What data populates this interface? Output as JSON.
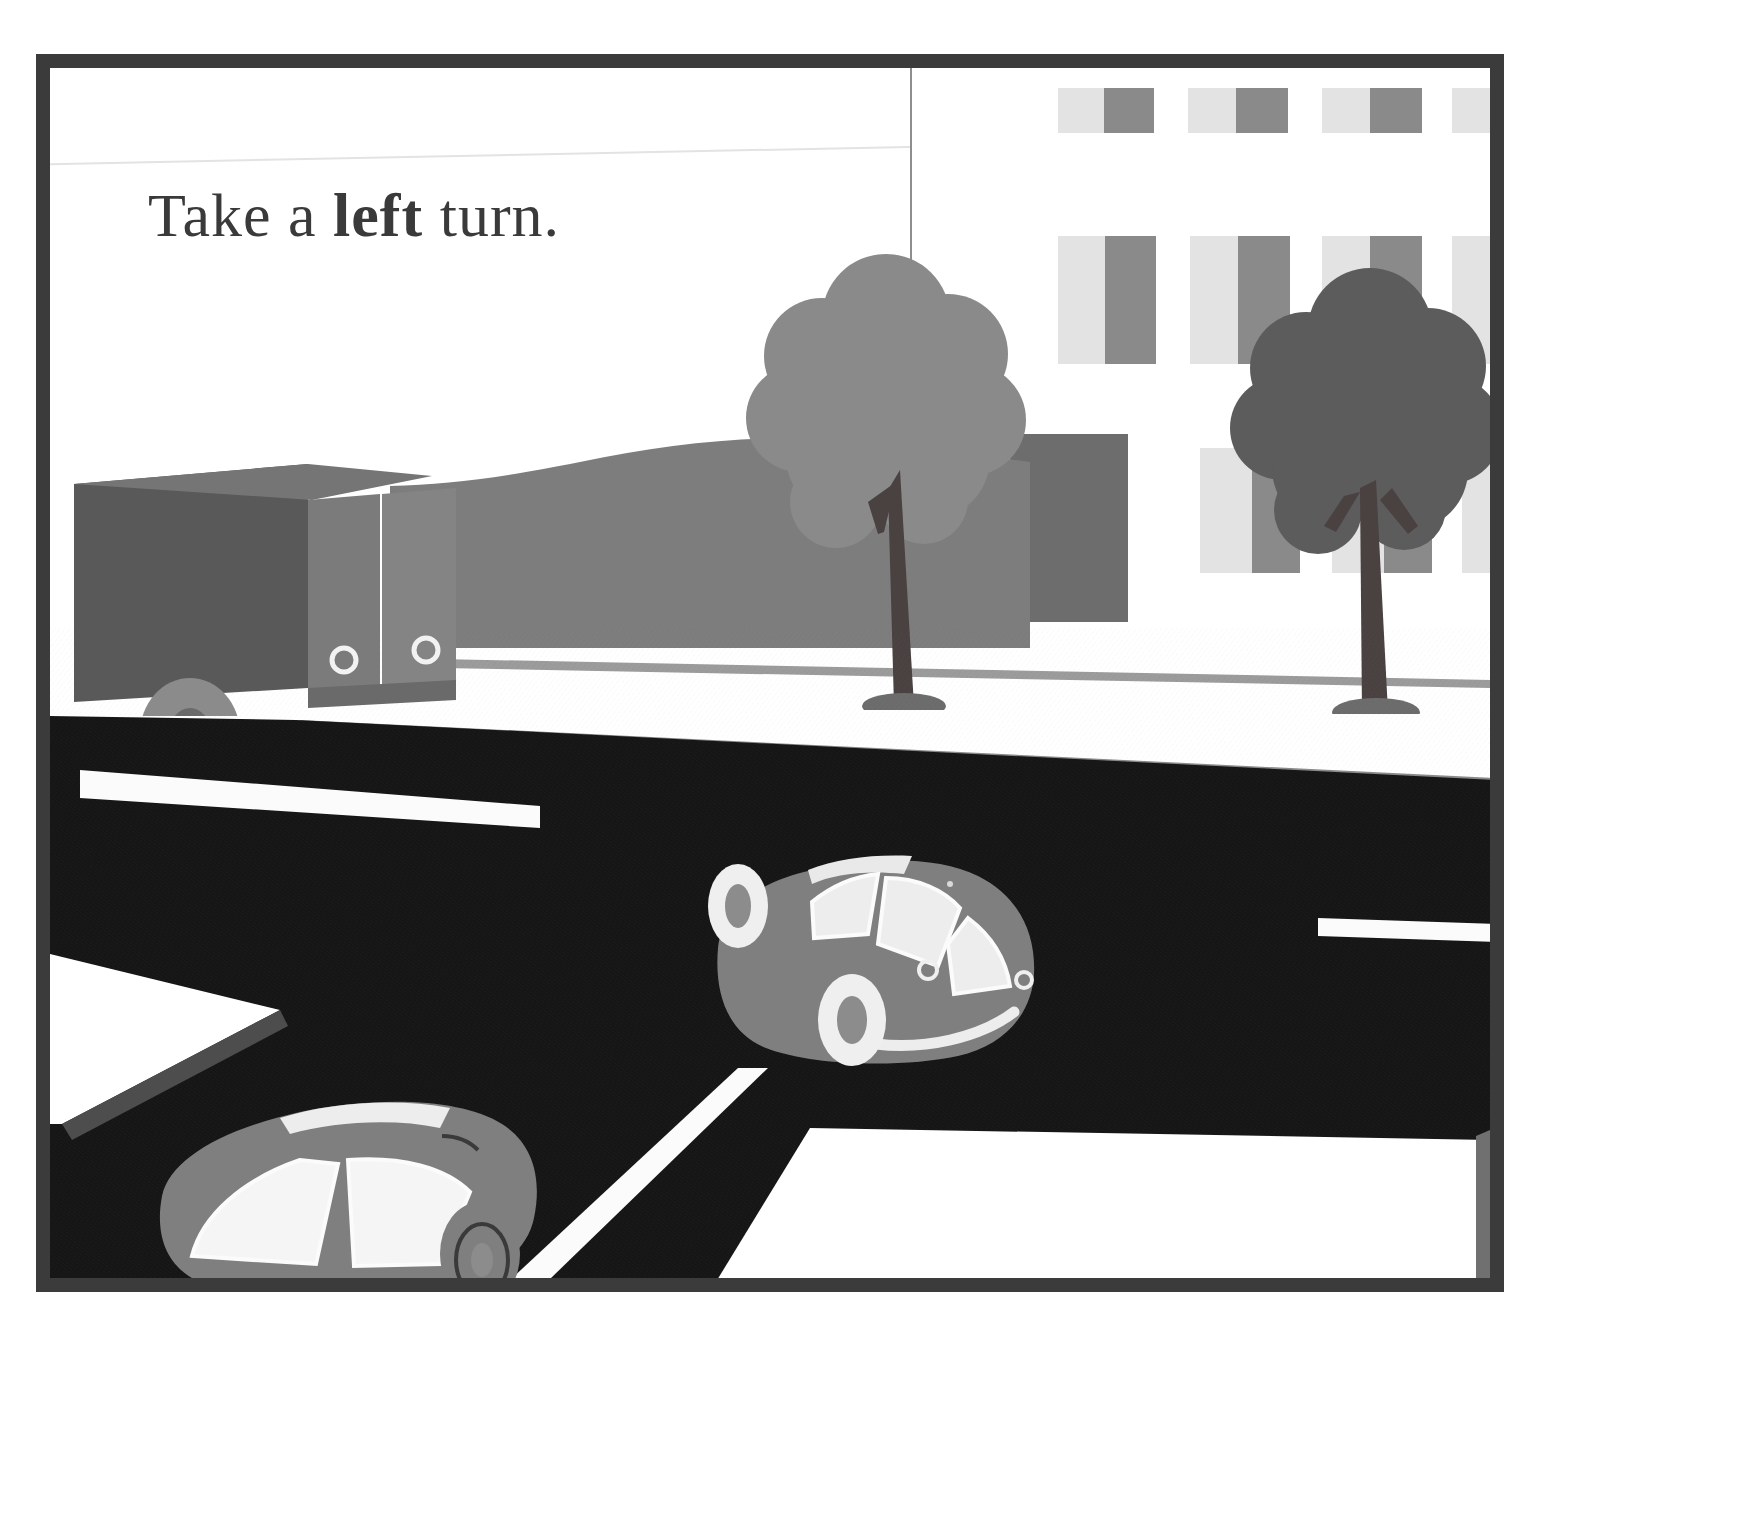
{
  "page": {
    "width": 1758,
    "height": 1521,
    "background": "#ffffff"
  },
  "illustration": {
    "title": "Take a left turn.",
    "style": "flat vector street scene illustration",
    "frame_color": "#3b3b3b"
  },
  "caption": {
    "text_before": "Take a ",
    "emphasis": "left",
    "text_after": " turn.",
    "full_text": "Take a left turn.",
    "color": "#3a3a3a"
  },
  "palette": {
    "sky": "#ffffff",
    "hill": "#7d7d7d",
    "road": "#161616",
    "road_marking": "#fbfbfb",
    "sidewalk": "#ffffff",
    "curb": "#8a8a8a",
    "car_body": "#7f7f7f",
    "car_glass": "#ededed",
    "truck_side": "#595959",
    "truck_front": "#7b7b7b",
    "tree_left_canopy": "#8a8a8a",
    "tree_right_canopy": "#5c5c5c",
    "tree_trunk": "#4a4141",
    "window_light": "#e3e3e3",
    "window_dark": "#8a8a8a",
    "door": "#6d6d6d",
    "frame": "#3b3b3b"
  },
  "scene_objects": {
    "sky": {
      "label": "sky backdrop"
    },
    "hill": {
      "label": "background hill"
    },
    "building": {
      "label": "city building",
      "windows": [
        {
          "id": "w1",
          "x": 148,
          "y": 20,
          "w": 95,
          "h": 45
        },
        {
          "id": "w2",
          "x": 278,
          "y": 20,
          "w": 100,
          "h": 45
        },
        {
          "id": "w3",
          "x": 410,
          "y": 20,
          "w": 100,
          "h": 45
        },
        {
          "id": "w4",
          "x": 540,
          "y": 20,
          "w": 75,
          "h": 45
        },
        {
          "id": "w5",
          "x": 148,
          "y": 168,
          "w": 98,
          "h": 128
        },
        {
          "id": "w6",
          "x": 280,
          "y": 168,
          "w": 100,
          "h": 128
        },
        {
          "id": "w7",
          "x": 410,
          "y": 168,
          "w": 100,
          "h": 128
        },
        {
          "id": "w8",
          "x": 540,
          "y": 168,
          "w": 75,
          "h": 128
        }
      ],
      "door": {
        "x": 158,
        "y": 372,
        "w": 118,
        "h": 180
      }
    },
    "tree_left": {
      "label": "street tree (light)",
      "canopy_color": "#8a8a8a"
    },
    "tree_right": {
      "label": "street tree (dark)",
      "canopy_color": "#5c5c5c"
    },
    "truck": {
      "label": "delivery truck",
      "door_handles": 2,
      "wheels": 1
    },
    "car_center": {
      "label": "car turning left",
      "wheels": 2,
      "windows": 3
    },
    "car_lower_left": {
      "label": "parked car",
      "wheels": 1,
      "windows": 2
    },
    "road": {
      "label": "asphalt road"
    },
    "lane_markings": [
      {
        "id": "m1",
        "label": "lane dash upper left"
      },
      {
        "id": "m2",
        "label": "lane dash right"
      },
      {
        "id": "m3",
        "label": "center line lower"
      }
    ],
    "crosswalks": [
      {
        "id": "c1",
        "label": "crosswalk lower left"
      },
      {
        "id": "c2",
        "label": "crosswalk lower right"
      }
    ],
    "sidewalk": {
      "label": "sidewalk with curb"
    }
  }
}
